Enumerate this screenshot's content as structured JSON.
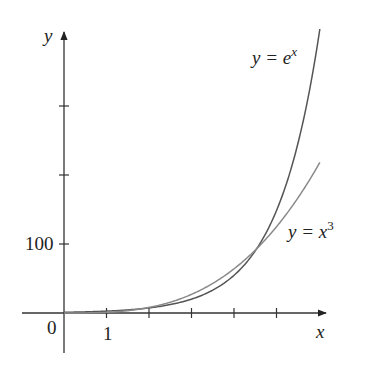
{
  "chart_data": {
    "type": "line",
    "title": "",
    "xlabel": "x",
    "ylabel": "y",
    "origin_label": "0",
    "x_ticks": [
      1,
      2,
      3,
      4,
      5
    ],
    "x_tick_labels": [
      {
        "value": 1,
        "label": "1"
      }
    ],
    "y_ticks": [
      100,
      200,
      300
    ],
    "y_tick_labels": [
      {
        "value": 100,
        "label": "100"
      }
    ],
    "xlim": [
      -1,
      6.2
    ],
    "ylim": [
      -58,
      410
    ],
    "grid": false,
    "legend": "inline labels near curves",
    "series": [
      {
        "name": "y = e^x",
        "label_main": "y = e",
        "label_sup": "x",
        "function": "exp(x)",
        "x_range": [
          0,
          6.02
        ],
        "color": "#555555",
        "points": [
          [
            0,
            1
          ],
          [
            1,
            2.72
          ],
          [
            2,
            7.39
          ],
          [
            3,
            20.1
          ],
          [
            4,
            54.6
          ],
          [
            4.54,
            93.6
          ],
          [
            5,
            148.4
          ],
          [
            5.5,
            244.7
          ],
          [
            6,
            403.4
          ]
        ]
      },
      {
        "name": "y = x^3",
        "label_main": "y = x",
        "label_sup": "3",
        "function": "x^3",
        "x_range": [
          0,
          6.02
        ],
        "color": "#8a8a8a",
        "points": [
          [
            0,
            0
          ],
          [
            1,
            1
          ],
          [
            2,
            8
          ],
          [
            3,
            27
          ],
          [
            4,
            64
          ],
          [
            4.54,
            93.6
          ],
          [
            5,
            125
          ],
          [
            5.5,
            166.4
          ],
          [
            6,
            216
          ]
        ]
      }
    ],
    "annotations": [
      "Curves intersect near x ≈ 4.54, y ≈ 93.6"
    ]
  }
}
